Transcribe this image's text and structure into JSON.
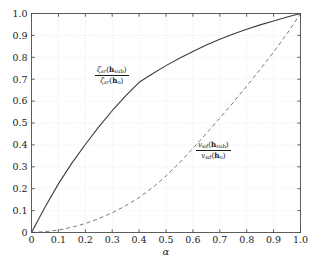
{
  "chart_data": {
    "type": "line",
    "title": "",
    "subtitle": "",
    "xlabel": "α",
    "ylabel": "",
    "xlim": [
      0,
      1
    ],
    "ylim": [
      0,
      1
    ],
    "grid": true,
    "legend_position": "inline-annotations",
    "xticks": [
      0,
      0.1,
      0.2,
      0.3,
      0.4,
      0.5,
      0.6,
      0.7,
      0.8,
      0.9,
      1.0
    ],
    "xticklabels": [
      "0",
      "0.1",
      "0.2",
      "0.3",
      "0.4",
      "0.5",
      "0.6",
      "0.7",
      "0.8",
      "0.9",
      "1.0"
    ],
    "yticks": [
      0,
      0.1,
      0.2,
      0.3,
      0.4,
      0.5,
      0.6,
      0.7,
      0.8,
      0.9,
      1.0
    ],
    "yticklabels": [
      "0",
      "0.1",
      "0.2",
      "0.3",
      "0.4",
      "0.5",
      "0.6",
      "0.7",
      "0.8",
      "0.9",
      "1.0"
    ],
    "x": [
      0,
      0.05,
      0.1,
      0.15,
      0.2,
      0.25,
      0.3,
      0.35,
      0.4,
      0.45,
      0.5,
      0.55,
      0.6,
      0.65,
      0.7,
      0.75,
      0.8,
      0.85,
      0.9,
      0.95,
      1.0
    ],
    "series": [
      {
        "name": "zeta_sr_ratio",
        "style": "solid",
        "color": "#3c3c3c",
        "label_numerator": "ζsr(hsub)",
        "label_denominator": "ζsr(ho)",
        "values": [
          0,
          0.115,
          0.222,
          0.317,
          0.402,
          0.482,
          0.556,
          0.624,
          0.686,
          0.725,
          0.762,
          0.796,
          0.827,
          0.856,
          0.882,
          0.906,
          0.928,
          0.948,
          0.966,
          0.984,
          1.0
        ]
      },
      {
        "name": "v_sd_ratio",
        "style": "dashed",
        "color": "#7a7a7a",
        "label_numerator": "vsd(hsub)",
        "label_denominator": "vsd(ho)",
        "values": [
          0,
          0.004,
          0.011,
          0.024,
          0.041,
          0.063,
          0.09,
          0.122,
          0.16,
          0.205,
          0.258,
          0.318,
          0.384,
          0.452,
          0.522,
          0.594,
          0.668,
          0.745,
          0.824,
          0.908,
          1.0
        ]
      }
    ]
  },
  "annotations": {
    "zeta": {
      "numerator_symbol": "ζ",
      "numerator_sub": "sr",
      "numerator_arg": "h",
      "numerator_arg_sub": "sub",
      "denominator_symbol": "ζ",
      "denominator_sub": "sr",
      "denominator_arg": "h",
      "denominator_arg_sub": "o"
    },
    "v": {
      "numerator_symbol": "v",
      "numerator_sub": "sd",
      "numerator_arg": "h",
      "numerator_arg_sub": "sub",
      "denominator_symbol": "v",
      "denominator_sub": "sd",
      "denominator_arg": "h",
      "denominator_arg_sub": "o"
    }
  },
  "colors": {
    "background": "#ffffff",
    "frame": "#4d4d4d",
    "grid": "#d8d8d8",
    "text": "#1a1a1a",
    "solid_curve": "#3c3c3c",
    "dashed_curve": "#7a7a7a"
  }
}
